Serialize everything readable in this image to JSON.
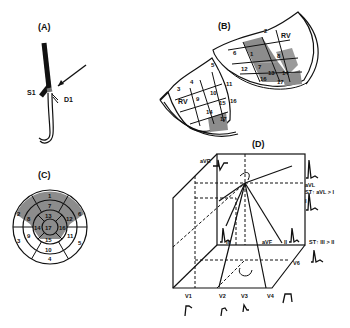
{
  "panels": {
    "A": {
      "label": "(A)",
      "annotations": {
        "septal_branch": "S1",
        "diagonal_branch": "D1"
      }
    },
    "B": {
      "label": "(B)",
      "rv_left": "RV",
      "rv_right": "RV",
      "segments_left": [
        "3",
        "4",
        "5",
        "9",
        "10",
        "11",
        "14",
        "15",
        "16",
        "17"
      ],
      "segments_right": [
        "1",
        "2",
        "6",
        "7",
        "8",
        "12",
        "13",
        "14",
        "16",
        "17"
      ]
    },
    "C": {
      "label": "(C)",
      "segments": [
        "1",
        "2",
        "3",
        "4",
        "5",
        "6",
        "7",
        "8",
        "9",
        "10",
        "11",
        "12",
        "13",
        "14",
        "15",
        "16",
        "17"
      ]
    },
    "D": {
      "label": "(D)",
      "leads": {
        "aVR": "aVR",
        "aVL": "aVL",
        "I": "I",
        "III": "III",
        "aVF": "aVF",
        "II": "II",
        "V1": "V1",
        "V2": "V2",
        "V3": "V3",
        "V4": "V4",
        "V6": "V6"
      },
      "notes": {
        "st_avl": "ST↑ aVL > I",
        "st_iii": "ST↑ III > II"
      }
    }
  },
  "colors": {
    "shade": "#8c8c8c",
    "line": "#111111"
  }
}
